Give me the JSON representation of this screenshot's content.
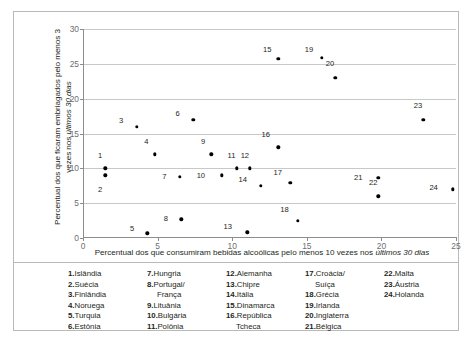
{
  "chart_data": {
    "type": "scatter",
    "title": "",
    "xlabel": "Percentual dos que consumiram bebidas alcoólicas pelo menos 10 vezes nos últimos 30 dias",
    "xlabel_plain": "Percentual dos que consumiram bebidas alcoólicas pelo menos 10 vezes nos ",
    "xlabel_italic": "últimos 30 dias",
    "ylabel_plain": "Percentual dos que ficaram embriagados pelo menos 3 vezes nos ",
    "ylabel_italic": "últimos 30 dias",
    "xlim": [
      0,
      25
    ],
    "ylim": [
      0,
      30
    ],
    "xticks": [
      0,
      5,
      10,
      15,
      20,
      25
    ],
    "yticks": [
      0,
      5,
      10,
      15,
      20,
      25,
      30
    ],
    "grid": "horizontal",
    "legend_position": "below-plot",
    "points": [
      {
        "id": 1,
        "label": "1",
        "name": "Islândia",
        "x": 1.5,
        "y": 10.0,
        "lx": -0.35,
        "ly": 1.9
      },
      {
        "id": 2,
        "label": "2",
        "name": "Suécia",
        "x": 1.5,
        "y": 9.0,
        "lx": -0.35,
        "ly": -1.9
      },
      {
        "id": 3,
        "label": "3",
        "name": "Finlândia",
        "x": 3.6,
        "y": 16.0,
        "lx": -1.05,
        "ly": 0.9
      },
      {
        "id": 4,
        "label": "4",
        "name": "Noruega",
        "x": 4.8,
        "y": 12.0,
        "lx": -0.55,
        "ly": 1.9
      },
      {
        "id": 5,
        "label": "5",
        "name": "Turquia",
        "x": 4.3,
        "y": 0.7,
        "lx": -1.0,
        "ly": 0.8
      },
      {
        "id": 6,
        "label": "6",
        "name": "Estônia",
        "x": 7.4,
        "y": 17.0,
        "lx": -1.05,
        "ly": 0.9
      },
      {
        "id": 7,
        "label": "7",
        "name": "Hungria",
        "x": 6.5,
        "y": 8.8,
        "lx": -1.05,
        "ly": 0.1
      },
      {
        "id": 8,
        "label": "8",
        "name": "Portugal/ França",
        "x": 6.6,
        "y": 2.7,
        "lx": -1.05,
        "ly": 0.1
      },
      {
        "id": 9,
        "label": "9",
        "name": "Lituânia",
        "x": 8.6,
        "y": 12.0,
        "lx": -0.55,
        "ly": 1.9
      },
      {
        "id": 10,
        "label": "10",
        "name": "Bulgária",
        "x": 9.3,
        "y": 9.0,
        "lx": -1.4,
        "ly": 0.1
      },
      {
        "id": 11,
        "label": "11",
        "name": "Polônia",
        "x": 10.3,
        "y": 10.0,
        "lx": -0.35,
        "ly": 1.9
      },
      {
        "id": 12,
        "label": "12",
        "name": "Alemanha",
        "x": 11.2,
        "y": 10.0,
        "lx": -0.35,
        "ly": 1.9
      },
      {
        "id": 13,
        "label": "13",
        "name": "Chipre",
        "x": 11.0,
        "y": 0.8,
        "lx": -1.3,
        "ly": 0.9
      },
      {
        "id": 14,
        "label": "14",
        "name": "Itália",
        "x": 11.9,
        "y": 7.5,
        "lx": -1.2,
        "ly": 0.9
      },
      {
        "id": 15,
        "label": "15",
        "name": "Dinamarca",
        "x": 13.1,
        "y": 25.7,
        "lx": -0.75,
        "ly": 1.4
      },
      {
        "id": 16,
        "label": "16",
        "name": "República Tcheca",
        "x": 13.1,
        "y": 13.0,
        "lx": -0.85,
        "ly": 1.9
      },
      {
        "id": 17,
        "label": "17",
        "name": "Croácia/ Suíça",
        "x": 13.9,
        "y": 7.9,
        "lx": -0.85,
        "ly": 1.6
      },
      {
        "id": 18,
        "label": "18",
        "name": "Grécia",
        "x": 14.4,
        "y": 2.5,
        "lx": -0.9,
        "ly": 1.7
      },
      {
        "id": 19,
        "label": "19",
        "name": "Irlanda",
        "x": 16.0,
        "y": 25.9,
        "lx": -0.85,
        "ly": 1.2
      },
      {
        "id": 20,
        "label": "20",
        "name": "Inglaterra",
        "x": 16.9,
        "y": 23.0,
        "lx": -0.35,
        "ly": 2.1
      },
      {
        "id": 21,
        "label": "21",
        "name": "Bélgica",
        "x": 19.8,
        "y": 8.6,
        "lx": -1.35,
        "ly": 0.1
      },
      {
        "id": 22,
        "label": "22",
        "name": "Malta",
        "x": 19.8,
        "y": 6.0,
        "lx": -0.35,
        "ly": 2.1
      },
      {
        "id": 23,
        "label": "23",
        "name": "Áustria",
        "x": 22.8,
        "y": 17.0,
        "lx": -0.35,
        "ly": 2.1
      },
      {
        "id": 24,
        "label": "24",
        "name": "Holanda",
        "x": 24.8,
        "y": 7.0,
        "lx": -1.3,
        "ly": 0.3
      }
    ]
  },
  "legend": {
    "columns": [
      [
        {
          "num": "1.",
          "name": "Islândia",
          "cont": ""
        },
        {
          "num": "2.",
          "name": "Suécia",
          "cont": ""
        },
        {
          "num": "3.",
          "name": "Finlândia",
          "cont": ""
        },
        {
          "num": "4.",
          "name": "Noruega",
          "cont": ""
        },
        {
          "num": "5.",
          "name": "Turquia",
          "cont": ""
        },
        {
          "num": "6.",
          "name": "Estônia",
          "cont": ""
        }
      ],
      [
        {
          "num": "7.",
          "name": "Hungria",
          "cont": ""
        },
        {
          "num": "8.",
          "name": "Portugal/",
          "cont": "França"
        },
        {
          "num": "9.",
          "name": "Lituânia",
          "cont": ""
        },
        {
          "num": "10.",
          "name": "Bulgária",
          "cont": ""
        },
        {
          "num": "11.",
          "name": "Polônia",
          "cont": ""
        }
      ],
      [
        {
          "num": "12.",
          "name": "Alemanha",
          "cont": ""
        },
        {
          "num": "13.",
          "name": "Chipre",
          "cont": ""
        },
        {
          "num": "14.",
          "name": "Itália",
          "cont": ""
        },
        {
          "num": "15.",
          "name": "Dinamarca",
          "cont": ""
        },
        {
          "num": "16.",
          "name": "República",
          "cont": "Tcheca"
        }
      ],
      [
        {
          "num": "17.",
          "name": "Croácia/",
          "cont": "Suíça"
        },
        {
          "num": "18.",
          "name": "Grécia",
          "cont": ""
        },
        {
          "num": "19.",
          "name": "Irlanda",
          "cont": ""
        },
        {
          "num": "20.",
          "name": "Inglaterra",
          "cont": ""
        },
        {
          "num": "21.",
          "name": "Bélgica",
          "cont": ""
        }
      ],
      [
        {
          "num": "22.",
          "name": "Malta",
          "cont": ""
        },
        {
          "num": "23.",
          "name": "Áustria",
          "cont": ""
        },
        {
          "num": "24.",
          "name": "Holanda",
          "cont": ""
        }
      ]
    ]
  },
  "colors": {
    "dot": "#000000",
    "grid": "#c8c8c8",
    "axis": "#8d8d8d",
    "frame": "#b9b9b9",
    "text": "#231f20",
    "tick_text": "#6d6e71"
  }
}
